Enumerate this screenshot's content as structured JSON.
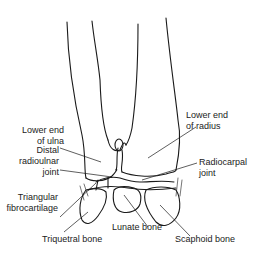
{
  "diagram": {
    "labels": {
      "lower_end_ulna": [
        "Lower end",
        "of ulna"
      ],
      "distal_radioulnar": [
        "Distal",
        "radioulnar",
        "joint"
      ],
      "triangular_fibrocartilage": [
        "Triangular",
        "fibrocartilage"
      ],
      "triquetral": "Triquetral bone",
      "lunate": "Lunate bone",
      "lower_end_radius": [
        "Lower end",
        "of radius"
      ],
      "radiocarpal": [
        "Radiocarpal",
        "joint"
      ],
      "scaphoid": "Scaphoid bone"
    },
    "colors": {
      "line": "#1a1a1a",
      "text": "#222222",
      "background": "#ffffff"
    }
  }
}
